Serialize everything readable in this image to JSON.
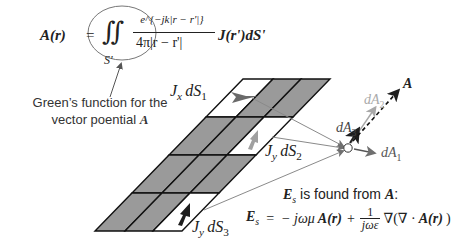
{
  "equation_A": {
    "lhs": "A(r)",
    "equals": "=",
    "integral": "∬",
    "domain": "S'",
    "numerator": "e^{−jk|r − r'|}",
    "denominator": "4π|r − r'|",
    "tail": "J(r')dS'"
  },
  "greens_label": {
    "line1": "Green’s function for the",
    "line2_prefix": "vector poential ",
    "line2_symbol": "A"
  },
  "cell_labels": {
    "cell1": {
      "J": "J",
      "sub_J": "x",
      "d": "dS",
      "sub_d": "1"
    },
    "cell2": {
      "J": "J",
      "sub_J": "y",
      "d": "dS",
      "sub_d": "2"
    },
    "cell3": {
      "J": "J",
      "sub_J": "y",
      "d": "dS",
      "sub_d": "3"
    }
  },
  "field_labels": {
    "A": "A",
    "dA1": {
      "base": "dA",
      "sub": "1"
    },
    "dA2": {
      "base": "dA",
      "sub": "2"
    },
    "dA3": {
      "base": "dA",
      "sub": "3"
    }
  },
  "es_statement": {
    "symbol": "E",
    "sub": "s",
    "text": " is found from ",
    "from": "A",
    "colon": ":"
  },
  "equation_E": {
    "lhs": "E",
    "lhs_sub": "s",
    "equals": "=",
    "term1": "− jωμ",
    "term1_A": "A(r)",
    "plus": "+",
    "frac_num": "1",
    "frac_den": "jωε",
    "term2": "∇(∇ · ",
    "term2_A": "A(r)",
    "term2_close": ")"
  },
  "colors": {
    "cell_gray": "#9a9a9a",
    "cell_white": "#ffffff",
    "grid_line": "#111111",
    "ray_line": "#8a8a8a",
    "arrow_dark": "#2a2a2a",
    "arrow_mid": "#6f6f6f",
    "arrow_light": "#a8a8a8"
  }
}
